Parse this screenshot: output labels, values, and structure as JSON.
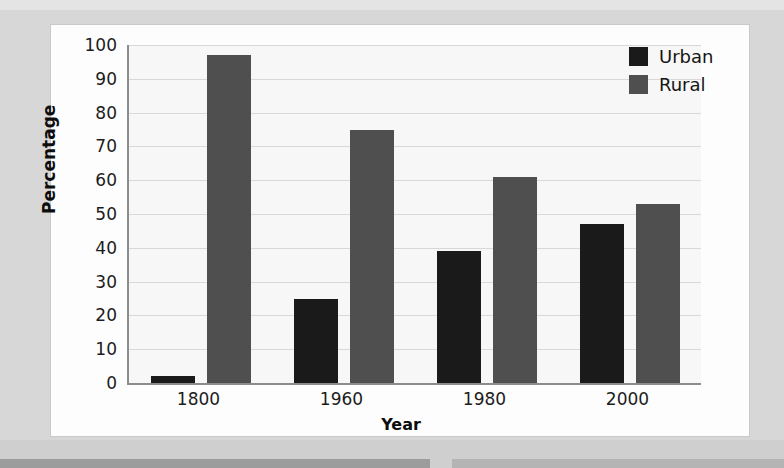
{
  "chart_data": {
    "type": "bar",
    "title": "",
    "xlabel": "Year",
    "ylabel": "Percentage",
    "categories": [
      "1800",
      "1960",
      "1980",
      "2000"
    ],
    "series": [
      {
        "name": "Urban",
        "color": "#1a1a1a",
        "values": [
          2,
          25,
          39,
          47
        ]
      },
      {
        "name": "Rural",
        "color": "#4f4f4f",
        "values": [
          97,
          75,
          61,
          53
        ]
      }
    ],
    "ylim": [
      0,
      100
    ],
    "yticks": [
      0,
      10,
      20,
      30,
      40,
      50,
      60,
      70,
      80,
      90,
      100
    ],
    "grid": true,
    "legend_position": "top-right"
  },
  "legend": {
    "entries": [
      {
        "label": "Urban",
        "swatch": "legend-swatch-urban"
      },
      {
        "label": "Rural",
        "swatch": "legend-swatch-rural"
      }
    ]
  },
  "colors": {
    "urban": "#1a1a1a",
    "rural": "#4f4f4f",
    "axis": "#8c8c8c",
    "grid": "#d8d8d8",
    "plot_background": "#f7f7f7",
    "card_background": "#fdfdfd",
    "page_background": "#d7d7d7"
  }
}
